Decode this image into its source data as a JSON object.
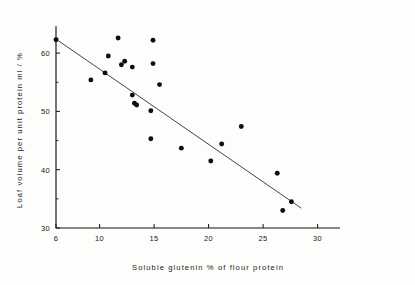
{
  "chart_data": {
    "type": "scatter",
    "title": "",
    "subtitle": "",
    "xlabel": "Soluble glutenin % of flour protein",
    "ylabel": "Loaf volume per unit protein ml / %",
    "xlim": [
      6,
      32
    ],
    "ylim": [
      30,
      64.5
    ],
    "x_ticks": [
      6,
      10,
      15,
      20,
      25,
      30
    ],
    "x_tick_labels": [
      "6",
      "10",
      "15",
      "20",
      "25",
      "30"
    ],
    "x_minor_ticks": [],
    "y_ticks": [
      30,
      40,
      50,
      60
    ],
    "y_tick_labels": [
      "30",
      "40",
      "50",
      "60"
    ],
    "y_minor_ticks": [
      35,
      45,
      55,
      62.5
    ],
    "grid": false,
    "legend": null,
    "marker": "filled-circle",
    "marker_color": "#0d0d0d",
    "line_color": "#3a3a3a",
    "axis_color": "#141414",
    "background": "#fdfdfb",
    "points": [
      {
        "x": 6.0,
        "y": 62.3
      },
      {
        "x": 9.2,
        "y": 55.4
      },
      {
        "x": 10.5,
        "y": 56.6
      },
      {
        "x": 10.8,
        "y": 59.5
      },
      {
        "x": 11.7,
        "y": 62.6
      },
      {
        "x": 12.0,
        "y": 58.0
      },
      {
        "x": 12.3,
        "y": 58.6
      },
      {
        "x": 13.0,
        "y": 57.6
      },
      {
        "x": 13.0,
        "y": 52.8
      },
      {
        "x": 13.2,
        "y": 51.4
      },
      {
        "x": 13.4,
        "y": 51.1
      },
      {
        "x": 14.7,
        "y": 50.1
      },
      {
        "x": 14.7,
        "y": 45.3
      },
      {
        "x": 14.9,
        "y": 62.2
      },
      {
        "x": 14.9,
        "y": 58.2
      },
      {
        "x": 15.5,
        "y": 54.6
      },
      {
        "x": 17.5,
        "y": 43.7
      },
      {
        "x": 20.2,
        "y": 41.5
      },
      {
        "x": 21.2,
        "y": 44.4
      },
      {
        "x": 23.0,
        "y": 47.4
      },
      {
        "x": 26.3,
        "y": 39.4
      },
      {
        "x": 26.8,
        "y": 33.0
      },
      {
        "x": 27.6,
        "y": 34.5
      }
    ],
    "fit_line": {
      "label": "regression line",
      "x_start": 6.0,
      "y_start": 62.4,
      "x_end": 28.5,
      "y_end": 33.4
    }
  }
}
